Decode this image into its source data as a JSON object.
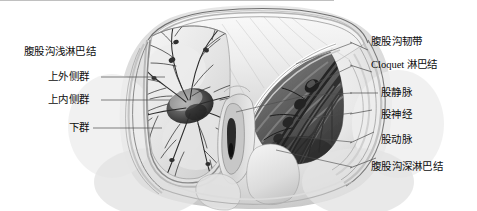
{
  "figure": {
    "type": "grayscale-anatomical-illustration",
    "region": "腹股沟区 / 股三角",
    "background_color": "#ffffff",
    "line_color": "#555555",
    "text_color": "#0d0d0d"
  },
  "labels_left": [
    {
      "id": "superficial-inguinal-nodes",
      "text": "腹股沟浅淋巴结",
      "has_leader": false
    },
    {
      "id": "supero-lateral-group",
      "text": "上外侧群",
      "has_leader": true
    },
    {
      "id": "supero-medial-group",
      "text": "上内侧群",
      "has_leader": true
    },
    {
      "id": "inferior-group",
      "text": "下群",
      "has_leader": true
    }
  ],
  "labels_right": [
    {
      "id": "inguinal-ligament",
      "text": "腹股沟韧带",
      "has_leader": true
    },
    {
      "id": "cloquet-node",
      "text": "Cloquet 淋巴结",
      "has_leader": true,
      "latin_prefix": "Cloquet"
    },
    {
      "id": "femoral-vein",
      "text": "股静脉",
      "has_leader": true
    },
    {
      "id": "femoral-nerve",
      "text": "股神经",
      "has_leader": true
    },
    {
      "id": "femoral-artery",
      "text": "股动脉",
      "has_leader": true
    },
    {
      "id": "deep-inguinal-nodes",
      "text": "腹股沟深淋巴结",
      "has_leader": true
    }
  ]
}
